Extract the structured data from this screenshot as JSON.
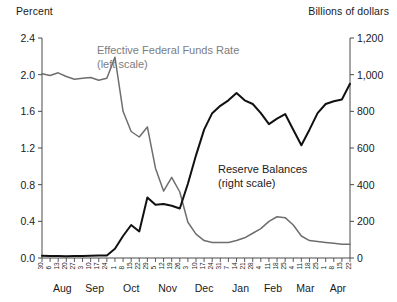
{
  "chart_data": {
    "type": "line",
    "title": "",
    "left_axis": {
      "label": "Percent",
      "ticks": [
        "0.0",
        "0.4",
        "0.8",
        "1.2",
        "1.6",
        "2.0",
        "2.4"
      ],
      "min": 0.0,
      "max": 2.4
    },
    "right_axis": {
      "label": "Billions of dollars",
      "ticks": [
        "0",
        "200",
        "400",
        "600",
        "800",
        "1,000",
        "1,200"
      ],
      "min": 0,
      "max": 1200
    },
    "xlabel": "",
    "grid": false,
    "legend_position": "inside",
    "months": [
      {
        "name": "Aug",
        "center_index": 2.5
      },
      {
        "name": "Sep",
        "center_index": 6.5
      },
      {
        "name": "Oct",
        "center_index": 11
      },
      {
        "name": "Nov",
        "center_index": 15.5
      },
      {
        "name": "Dec",
        "center_index": 20
      },
      {
        "name": "Jan",
        "center_index": 24.5
      },
      {
        "name": "Feb",
        "center_index": 28.5
      },
      {
        "name": "Mar",
        "center_index": 32.5
      },
      {
        "name": "Apr",
        "center_index": 36.5
      }
    ],
    "x": [
      "30",
      "6",
      "13",
      "20",
      "27",
      "3",
      "10",
      "17",
      "24",
      "1",
      "8",
      "15",
      "22",
      "29",
      "5",
      "12",
      "19",
      "26",
      "3",
      "10",
      "17",
      "24",
      "31",
      "7",
      "14",
      "21",
      "28",
      "4",
      "11",
      "18",
      "25",
      "4",
      "11",
      "18",
      "25",
      "1",
      "8",
      "15",
      "22"
    ],
    "series": [
      {
        "name": "Effective Federal Funds Rate",
        "scale": "left",
        "units": "Percent",
        "color": "#6e6e6e",
        "annotation": "(left scale)",
        "values": [
          2.01,
          1.99,
          2.02,
          1.98,
          1.95,
          1.96,
          1.97,
          1.94,
          1.96,
          2.19,
          1.6,
          1.38,
          1.32,
          1.43,
          0.98,
          0.73,
          0.88,
          0.72,
          0.39,
          0.26,
          0.19,
          0.17,
          0.17,
          0.17,
          0.19,
          0.22,
          0.27,
          0.32,
          0.4,
          0.45,
          0.44,
          0.36,
          0.24,
          0.19,
          0.18,
          0.17,
          0.16,
          0.15,
          0.15
        ]
      },
      {
        "name": "Reserve Balances",
        "scale": "right",
        "units": "Billions of dollars",
        "color": "#111111",
        "annotation": "(right scale)",
        "values": [
          12,
          11,
          11,
          10,
          11,
          11,
          12,
          13,
          14,
          50,
          120,
          180,
          145,
          330,
          290,
          295,
          285,
          270,
          405,
          560,
          700,
          790,
          830,
          860,
          900,
          860,
          840,
          790,
          730,
          760,
          785,
          700,
          615,
          700,
          790,
          840,
          855,
          865,
          950
        ]
      }
    ]
  }
}
